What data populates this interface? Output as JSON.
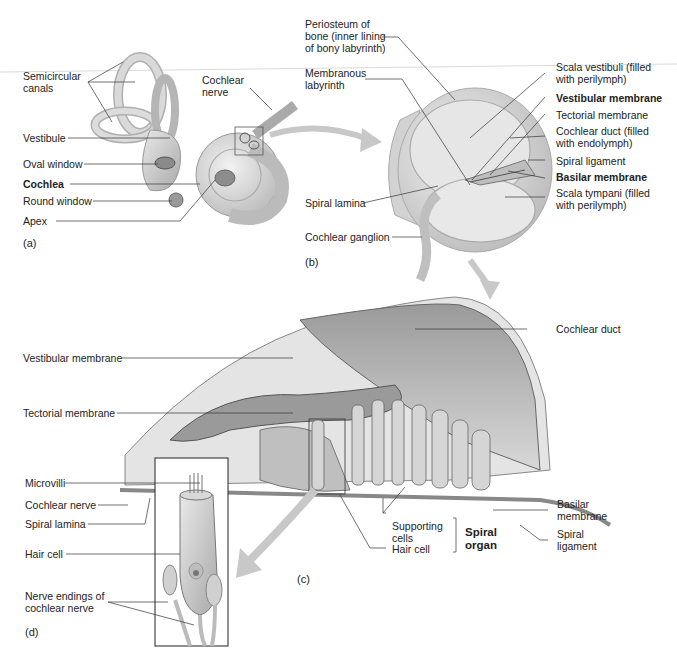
{
  "figure": {
    "panels": {
      "a": "(a)",
      "b": "(b)",
      "c": "(c)",
      "d": "(d)"
    },
    "panel_a": {
      "labels": {
        "semicircular_canals": "Semicircular\ncanals",
        "cochlear_nerve": "Cochlear\nnerve",
        "vestibule": "Vestibule",
        "oval_window": "Oval window",
        "cochlea": "Cochlea",
        "round_window": "Round window",
        "apex": "Apex"
      }
    },
    "panel_b": {
      "labels": {
        "periosteum": "Periosteum of\nbone (inner lining\nof bony labyrinth)",
        "membranous_labyrinth": "Membranous\nlabyrinth",
        "scala_vestibuli": "Scala vestibuli (filled\nwith perilymph)",
        "vestibular_membrane": "Vestibular membrane",
        "tectorial_membrane": "Tectorial membrane",
        "cochlear_duct": "Cochlear duct (filled\nwith endolymph)",
        "spiral_ligament": "Spiral ligament",
        "basilar_membrane": "Basilar membrane",
        "scala_tympani": "Scala tympani (filled\nwith perilymph)",
        "spiral_lamina": "Spiral lamina",
        "cochlear_ganglion": "Cochlear ganglion"
      }
    },
    "panel_c": {
      "labels": {
        "cochlear_duct": "Cochlear duct",
        "vestibular_membrane": "Vestibular membrane",
        "tectorial_membrane": "Tectorial membrane",
        "basilar_membrane": "Basilar\nmembrane",
        "spiral_ligament": "Spiral\nligament",
        "supporting_cells": "Supporting\ncells",
        "hair_cell": "Hair cell",
        "spiral_organ": "Spiral\norgan"
      }
    },
    "panel_d": {
      "labels": {
        "microvilli": "Microvilli",
        "cochlear_nerve": "Cochlear nerve",
        "spiral_lamina": "Spiral lamina",
        "hair_cell": "Hair cell",
        "nerve_endings": "Nerve endings of\ncochlear nerve"
      }
    }
  }
}
